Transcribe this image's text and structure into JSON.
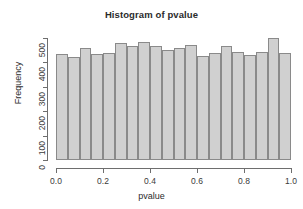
{
  "chart_data": {
    "type": "bar",
    "title": "Histogram of pvalue",
    "xlabel": "pvalue",
    "ylabel": "Frequency",
    "xlim": [
      0.0,
      1.0
    ],
    "ylim": [
      0,
      560
    ],
    "grid": false,
    "legend": null,
    "bin_width": 0.05,
    "bin_count": 20,
    "x_tick_labels": [
      "0.0",
      "0.2",
      "0.4",
      "0.6",
      "0.8",
      "1.0"
    ],
    "x_tick_values": [
      0.0,
      0.2,
      0.4,
      0.6,
      0.8,
      1.0
    ],
    "y_tick_labels": [
      "0",
      "100",
      "200",
      "300",
      "400",
      "500"
    ],
    "y_tick_values": [
      0,
      100,
      200,
      300,
      400,
      500
    ],
    "categories": [
      "0.00-0.05",
      "0.05-0.10",
      "0.10-0.15",
      "0.15-0.20",
      "0.20-0.25",
      "0.25-0.30",
      "0.30-0.35",
      "0.35-0.40",
      "0.40-0.45",
      "0.45-0.50",
      "0.50-0.55",
      "0.55-0.60",
      "0.60-0.65",
      "0.65-0.70",
      "0.70-0.75",
      "0.75-0.80",
      "0.80-0.85",
      "0.85-0.90",
      "0.90-0.95",
      "0.95-1.00"
    ],
    "bin_starts": [
      0.0,
      0.05,
      0.1,
      0.15,
      0.2,
      0.25,
      0.3,
      0.35,
      0.4,
      0.45,
      0.5,
      0.55,
      0.6,
      0.65,
      0.7,
      0.75,
      0.8,
      0.85,
      0.9,
      0.95
    ],
    "values": [
      487,
      472,
      512,
      488,
      490,
      536,
      524,
      541,
      523,
      505,
      514,
      529,
      477,
      490,
      522,
      498,
      484,
      497,
      562,
      491
    ],
    "bar_fill_color": "#d0d0d0",
    "bar_border_color": "#8a8a8a",
    "axis_color": "#6e6e6e",
    "text_color": "#2b2b2b",
    "background_color": "#ffffff"
  }
}
